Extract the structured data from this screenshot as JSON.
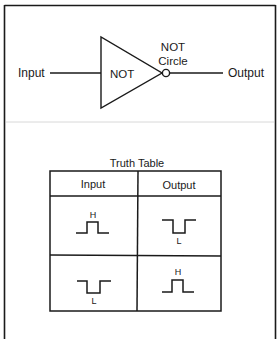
{
  "gate_diagram": {
    "input_label": "Input",
    "gate_label": "NOT",
    "circle_label_line1": "NOT",
    "circle_label_line2": "Circle",
    "output_label": "Output"
  },
  "truth_table": {
    "title": "Truth Table",
    "headers": [
      "Input",
      "Output"
    ],
    "rows": [
      {
        "input": {
          "waveform": "high-pulse",
          "level_label": "H"
        },
        "output": {
          "waveform": "low-pulse",
          "level_label": "L"
        }
      },
      {
        "input": {
          "waveform": "low-pulse",
          "level_label": "L"
        },
        "output": {
          "waveform": "high-pulse",
          "level_label": "H"
        }
      }
    ]
  },
  "colors": {
    "line": "#1a1a1a",
    "separator": "#d8d8d8",
    "background": "#ffffff"
  }
}
